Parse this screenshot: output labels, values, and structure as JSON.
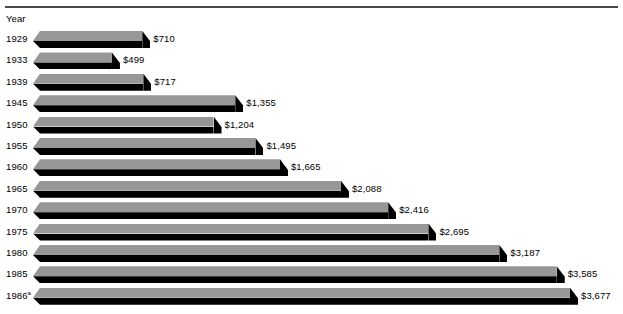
{
  "chart_data": {
    "type": "bar",
    "orientation": "horizontal",
    "title": "",
    "subtitle": "",
    "xlabel": "",
    "ylabel": "Year",
    "axis_caption": "Year",
    "grid": false,
    "legend": null,
    "value_prefix": "$",
    "categories": [
      "1929",
      "1933",
      "1939",
      "1945",
      "1950",
      "1955",
      "1960",
      "1965",
      "1970",
      "1975",
      "1980",
      "1985",
      "1986"
    ],
    "values": [
      710,
      499,
      717,
      1355,
      1204,
      1495,
      1665,
      2088,
      2416,
      2695,
      3187,
      3585,
      3677
    ],
    "value_labels": [
      "$710",
      "$499",
      "$717",
      "$1,355",
      "$1,204",
      "$1,495",
      "$1,665",
      "$2,088",
      "$2,416",
      "$2,695",
      "$3,187",
      "$3,585",
      "$3,677"
    ],
    "xlim": [
      0,
      3677
    ],
    "bars": [
      {
        "year": "1929",
        "footnote": "",
        "value": 710,
        "label": "$710"
      },
      {
        "year": "1933",
        "footnote": "",
        "value": 499,
        "label": "$499"
      },
      {
        "year": "1939",
        "footnote": "",
        "value": 717,
        "label": "$717"
      },
      {
        "year": "1945",
        "footnote": "",
        "value": 1355,
        "label": "$1,355"
      },
      {
        "year": "1950",
        "footnote": "",
        "value": 1204,
        "label": "$1,204"
      },
      {
        "year": "1955",
        "footnote": "",
        "value": 1495,
        "label": "$1,495"
      },
      {
        "year": "1960",
        "footnote": "",
        "value": 1665,
        "label": "$1,665"
      },
      {
        "year": "1965",
        "footnote": "",
        "value": 2088,
        "label": "$2,088"
      },
      {
        "year": "1970",
        "footnote": "",
        "value": 2416,
        "label": "$2,416"
      },
      {
        "year": "1975",
        "footnote": "",
        "value": 2695,
        "label": "$2,695"
      },
      {
        "year": "1980",
        "footnote": "",
        "value": 3187,
        "label": "$3,187"
      },
      {
        "year": "1985",
        "footnote": "",
        "value": 3585,
        "label": "$3,585"
      },
      {
        "year": "1986",
        "footnote": "a",
        "value": 3677,
        "label": "$3,677"
      }
    ],
    "colors": {
      "bar_top": "#979797",
      "bar_shadow": "#000000",
      "rule": "#4a4a4a",
      "text": "#000000",
      "background": "#ffffff"
    }
  }
}
